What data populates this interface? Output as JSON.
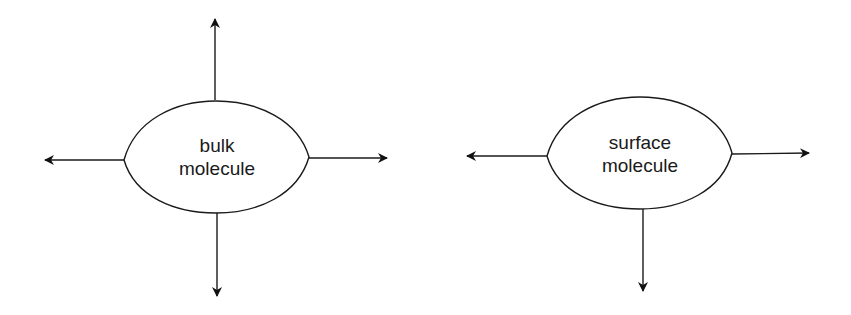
{
  "diagram": {
    "type": "force-diagram",
    "stroke_color": "#1a1a1a",
    "background": "#ffffff",
    "molecules": [
      {
        "id": "bulk",
        "label_lines": [
          "bulk",
          "molecule"
        ],
        "center": [
          216,
          157
        ],
        "arrows": [
          "up",
          "down",
          "left",
          "right"
        ]
      },
      {
        "id": "surface",
        "label_lines": [
          "surface",
          "molecule"
        ],
        "center": [
          640,
          153
        ],
        "arrows": [
          "down",
          "left",
          "right"
        ]
      }
    ]
  }
}
